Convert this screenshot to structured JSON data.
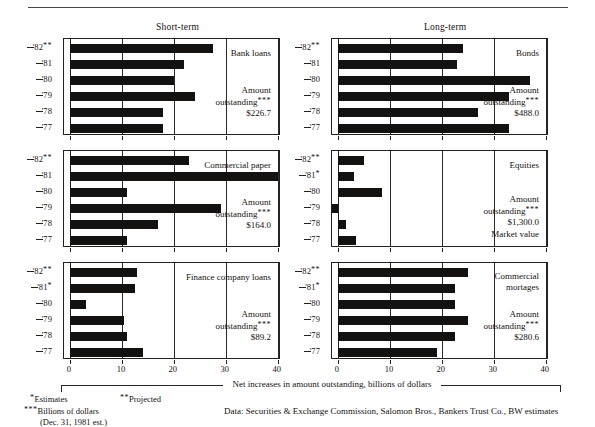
{
  "figure": {
    "column_headings": [
      "Short-term",
      "Long-term"
    ],
    "caption": "Net increases in amount outstanding, billions of dollars",
    "footnotes": {
      "estimates": "*Estimates",
      "projected": "**Projected",
      "billions": "***Billions of dollars",
      "dec_note": "(Dec. 31, 1981 est.)",
      "data_source": "Data: Securities & Exchange Commission, Salomon Bros., Bankers Trust Co., BW estimates"
    },
    "amount_label_line1": "Amount",
    "amount_label_line2": "outstanding***"
  },
  "chart_data": [
    {
      "type": "bar",
      "title": "Bank loans",
      "group": "Short-term",
      "orientation": "horizontal",
      "categories": [
        "'82**",
        "'81",
        "'80",
        "'79",
        "'78",
        "'77"
      ],
      "values": [
        27.5,
        22.0,
        20.0,
        24.0,
        18.0,
        18.0
      ],
      "xlabel": "Net increases in amount outstanding, billions of dollars",
      "ylabel": "",
      "xlim": [
        0,
        40
      ],
      "xticks": [
        0,
        10,
        20,
        30,
        40
      ],
      "grid": true,
      "annotation_amount": "$226.7",
      "annotation_extra": ""
    },
    {
      "type": "bar",
      "title": "Bonds",
      "group": "Long-term",
      "orientation": "horizontal",
      "categories": [
        "'82**",
        "'81",
        "'80",
        "'79",
        "'78",
        "'77"
      ],
      "values": [
        24.0,
        23.0,
        37.0,
        33.0,
        27.0,
        33.0
      ],
      "xlabel": "Net increases in amount outstanding, billions of dollars",
      "ylabel": "",
      "xlim": [
        0,
        40
      ],
      "xticks": [
        0,
        10,
        20,
        30,
        40
      ],
      "grid": true,
      "annotation_amount": "$488.0",
      "annotation_extra": ""
    },
    {
      "type": "bar",
      "title": "Commercial paper",
      "group": "Short-term",
      "orientation": "horizontal",
      "categories": [
        "'82**",
        "'81",
        "'80",
        "'79",
        "'78",
        "'77"
      ],
      "values": [
        23.0,
        40.0,
        11.0,
        29.0,
        17.0,
        11.0
      ],
      "xlabel": "Net increases in amount outstanding, billions of dollars",
      "ylabel": "",
      "xlim": [
        0,
        40
      ],
      "xticks": [
        0,
        10,
        20,
        30,
        40
      ],
      "grid": true,
      "annotation_amount": "$164.0",
      "annotation_extra": ""
    },
    {
      "type": "bar",
      "title": "Equities",
      "group": "Long-term",
      "orientation": "horizontal",
      "categories": [
        "'82**",
        "'81*",
        "'80",
        "'79",
        "'78",
        "'77"
      ],
      "values": [
        5.0,
        3.0,
        8.5,
        -2.0,
        1.5,
        3.5
      ],
      "xlabel": "Net increases in amount outstanding, billions of dollars",
      "ylabel": "",
      "xlim": [
        0,
        40
      ],
      "xticks": [
        0,
        10,
        20,
        30,
        40
      ],
      "grid": true,
      "annotation_amount": "$1,300.0",
      "annotation_extra": "Market value"
    },
    {
      "type": "bar",
      "title": "Finance company loans",
      "group": "Short-term",
      "orientation": "horizontal",
      "categories": [
        "'82**",
        "'81*",
        "'80",
        "'79",
        "'78",
        "'77"
      ],
      "values": [
        13.0,
        12.5,
        3.0,
        10.5,
        11.0,
        14.0
      ],
      "xlabel": "Net increases in amount outstanding, billions of dollars",
      "ylabel": "",
      "xlim": [
        0,
        40
      ],
      "xticks": [
        0,
        10,
        20,
        30,
        40
      ],
      "grid": true,
      "annotation_amount": "$89.2",
      "annotation_extra": ""
    },
    {
      "type": "bar",
      "title": "Commercial\nmortages",
      "group": "Long-term",
      "orientation": "horizontal",
      "categories": [
        "'82**",
        "'81*",
        "'80",
        "'79",
        "'78",
        "'77"
      ],
      "values": [
        25.0,
        22.5,
        22.5,
        25.0,
        22.5,
        19.0
      ],
      "xlabel": "Net increases in amount outstanding, billions of dollars",
      "ylabel": "",
      "xlim": [
        0,
        40
      ],
      "xticks": [
        0,
        10,
        20,
        30,
        40
      ],
      "grid": true,
      "annotation_amount": "$280.6",
      "annotation_extra": ""
    }
  ]
}
